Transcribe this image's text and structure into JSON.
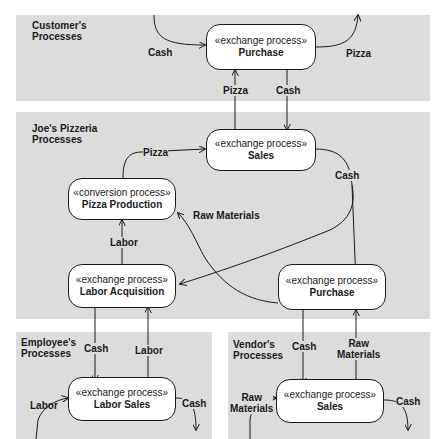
{
  "panels": {
    "customer": {
      "title_line1": "Customer's",
      "title_line2": "Processes"
    },
    "joes": {
      "title_line1": "Joe's Pizzeria",
      "title_line2": "Processes"
    },
    "employee": {
      "title_line1": "Employee's",
      "title_line2": "Processes"
    },
    "vendor": {
      "title_line1": "Vendor's",
      "title_line2": "Processes"
    }
  },
  "nodes": {
    "customer_purchase": {
      "stereotype": "«exchange process»",
      "name": "Purchase"
    },
    "joes_sales": {
      "stereotype": "«exchange process»",
      "name": "Sales"
    },
    "pizza_production": {
      "stereotype": "«conversion process»",
      "name": "Pizza Production"
    },
    "labor_acquisition": {
      "stereotype": "«exchange process»",
      "name": "Labor Acquisition"
    },
    "joes_purchase": {
      "stereotype": "«exchange process»",
      "name": "Purchase"
    },
    "labor_sales": {
      "stereotype": "«exchange process»",
      "name": "Labor Sales"
    },
    "vendor_sales": {
      "stereotype": "«exchange process»",
      "name": "Sales"
    }
  },
  "flows": {
    "cash_in_customer": "Cash",
    "pizza_out_customer": "Pizza",
    "pizza_sales_to_purchase": "Pizza",
    "cash_purchase_to_sales": "Cash",
    "pizza_production_to_sales": "Pizza",
    "cash_sales_out": "Cash",
    "raw_materials": "Raw Materials",
    "labor_to_production": "Labor",
    "cash_to_employee": "Cash",
    "labor_from_employee": "Labor",
    "labor_in_employee": "Labor",
    "cash_out_employee": "Cash",
    "cash_to_vendor": "Cash",
    "raw_materials_from_vendor_line1": "Raw",
    "raw_materials_from_vendor_line2": "Materials",
    "raw_in_vendor_line1": "Raw",
    "raw_in_vendor_line2": "Materials",
    "cash_out_vendor": "Cash"
  },
  "colors": {
    "panel": "#dcdcdc",
    "node_fill": "#ffffff",
    "stroke": "#1a1a1a",
    "background": "#ffffff"
  }
}
